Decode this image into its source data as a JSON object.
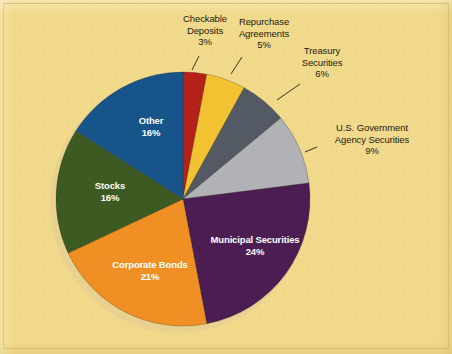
{
  "figure": {
    "background_color": "#f2db8c",
    "pie": {
      "center_x": 183,
      "center_y": 199,
      "radius": 127,
      "start_angle_deg": -90,
      "direction": "clockwise",
      "shadow_color": "#e8d092"
    }
  },
  "chart_data": {
    "type": "pie",
    "title": "",
    "subtitle": "",
    "xlabel": "",
    "ylabel": "",
    "units": "percent",
    "total": 100,
    "legend_position": "none",
    "grid": false,
    "categories": [
      "Checkable Deposits",
      "Repurchase Agreements",
      "Treasury Securities",
      "U.S. Government Agency Securities",
      "Municipal Securities",
      "Corporate Bonds",
      "Stocks",
      "Other"
    ],
    "values": [
      3,
      5,
      6,
      9,
      24,
      21,
      16,
      16
    ],
    "value_labels": [
      "3%",
      "5%",
      "6%",
      "9%",
      "24%",
      "21%",
      "16%",
      "16%"
    ],
    "colors": [
      "#b32119",
      "#f2c233",
      "#545a63",
      "#b0b2b5",
      "#4b1d52",
      "#ef8f24",
      "#3d5a22",
      "#17548a"
    ],
    "slices": [
      {
        "name": "Checkable Deposits",
        "value": 3,
        "value_label": "3%",
        "color": "#b32119",
        "label_line1": "Checkable",
        "label_line2": "Deposits",
        "label_placement": "outside",
        "label_x": 205,
        "label_y": 22,
        "leader": {
          "x1": 199,
          "y1": 56,
          "x2": 192,
          "y2": 70
        }
      },
      {
        "name": "Repurchase Agreements",
        "value": 5,
        "value_label": "5%",
        "color": "#f2c233",
        "label_line1": "Repurchase",
        "label_line2": "Agreements",
        "label_placement": "outside",
        "label_x": 264,
        "label_y": 25,
        "leader": {
          "x1": 242,
          "y1": 57,
          "x2": 231,
          "y2": 74
        }
      },
      {
        "name": "Treasury Securities",
        "value": 6,
        "value_label": "6%",
        "color": "#545a63",
        "label_line1": "Treasury",
        "label_line2": "Securities",
        "label_placement": "outside",
        "label_x": 322,
        "label_y": 54,
        "leader": {
          "x1": 300,
          "y1": 84,
          "x2": 277,
          "y2": 100
        }
      },
      {
        "name": "U.S. Government Agency Securities",
        "value": 9,
        "value_label": "9%",
        "color": "#b0b2b5",
        "label_line1": "U.S. Government",
        "label_line2": "Agency Securities",
        "label_placement": "outside",
        "label_x": 372,
        "label_y": 131,
        "leader": {
          "x1": 317,
          "y1": 147,
          "x2": 305,
          "y2": 152
        }
      },
      {
        "name": "Municipal Securities",
        "value": 24,
        "value_label": "24%",
        "color": "#4b1d52",
        "label_line1": "Municipal Securities",
        "label_line2": "",
        "label_placement": "inside",
        "label_x": 255,
        "label_y": 243
      },
      {
        "name": "Corporate Bonds",
        "value": 21,
        "value_label": "21%",
        "color": "#ef8f24",
        "label_line1": "Corporate Bonds",
        "label_line2": "",
        "label_placement": "inside",
        "label_x": 150,
        "label_y": 268
      },
      {
        "name": "Stocks",
        "value": 16,
        "value_label": "16%",
        "color": "#3d5a22",
        "label_line1": "Stocks",
        "label_line2": "",
        "label_placement": "inside",
        "label_x": 110,
        "label_y": 189
      },
      {
        "name": "Other",
        "value": 16,
        "value_label": "16%",
        "color": "#17548a",
        "label_line1": "Other",
        "label_line2": "",
        "label_placement": "inside",
        "label_x": 151,
        "label_y": 124
      }
    ]
  }
}
